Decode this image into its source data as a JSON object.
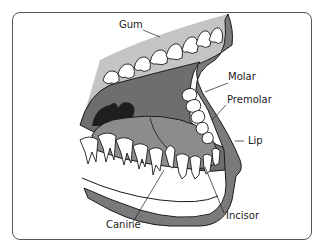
{
  "diagram": {
    "type": "anatomical-illustration",
    "labels": {
      "gum": "Gum",
      "molar": "Molar",
      "premolar": "Premolar",
      "lip": "Lip",
      "incisor": "Incisor",
      "canine": "Canine"
    },
    "colors": {
      "gum": "#c4c4c4",
      "mouth_interior": "#6e6e6e",
      "tongue": "#8c8c8c",
      "throat": "#1e1e1e",
      "lip": "#7a7a7a",
      "tooth": "#ffffff",
      "outline": "#1a1a1a",
      "frame": "#555555"
    }
  }
}
